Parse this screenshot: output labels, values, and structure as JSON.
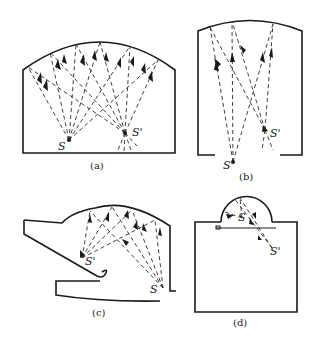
{
  "figure": {
    "panels": [
      {
        "id": "a",
        "caption": "(a)",
        "source_label": "S",
        "image_label": "S'"
      },
      {
        "id": "b",
        "caption": "(b)",
        "source_label": "S",
        "image_label": "S'"
      },
      {
        "id": "c",
        "caption": "(c)",
        "source_label": "S",
        "image_label": "S'"
      },
      {
        "id": "d",
        "caption": "(d)",
        "source_label": "S",
        "image_label": "S'"
      }
    ],
    "colors": {
      "line": "#1a1a1a",
      "background": "#ffffff"
    }
  }
}
